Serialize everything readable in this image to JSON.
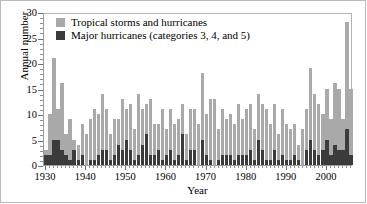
{
  "chart_data": {
    "type": "bar",
    "title": "",
    "xlabel": "Year",
    "ylabel": "Annual number",
    "xlim": [
      1929.5,
      2006.5
    ],
    "ylim": [
      0,
      30
    ],
    "yticks": [
      0,
      5,
      10,
      15,
      20,
      25,
      30
    ],
    "xticks": [
      1930,
      1940,
      1950,
      1960,
      1970,
      1980,
      1990,
      2000
    ],
    "grid": false,
    "stacked": true,
    "legend_position": "top-left",
    "colors": {
      "total": "#a9a9a9",
      "major": "#3b3b3b"
    },
    "series": [
      {
        "name": "Tropical storms and hurricanes",
        "color": "#a9a9a9",
        "values": [
          3,
          10,
          21,
          11,
          16,
          6,
          9,
          5,
          4,
          8,
          6,
          9,
          11,
          10,
          14,
          11,
          6,
          9,
          9,
          13,
          11,
          12,
          7,
          14,
          11,
          12,
          13,
          8,
          8,
          11,
          7,
          11,
          8,
          9,
          12,
          6,
          11,
          11,
          8,
          18,
          10,
          13,
          13,
          7,
          11,
          9,
          10,
          8,
          12,
          9,
          11,
          12,
          7,
          14,
          12,
          11,
          8,
          12,
          6,
          11,
          8,
          7,
          8,
          4,
          7,
          11,
          19,
          14,
          12,
          10,
          15,
          9,
          16,
          15,
          9,
          28,
          15
        ]
      },
      {
        "name": "Major hurricanes (categories 3, 4, and 5)",
        "color": "#3b3b3b",
        "values": [
          2,
          2,
          5,
          5,
          3,
          2,
          1,
          3,
          1,
          2,
          0,
          1,
          1,
          2,
          3,
          3,
          1,
          2,
          4,
          3,
          5,
          3,
          1,
          2,
          4,
          6,
          2,
          2,
          3,
          1,
          2,
          3,
          1,
          2,
          6,
          1,
          3,
          3,
          0,
          5,
          2,
          1,
          0,
          1,
          2,
          2,
          2,
          1,
          2,
          2,
          2,
          3,
          1,
          5,
          3,
          1,
          1,
          3,
          1,
          2,
          1,
          1,
          2,
          1,
          0,
          3,
          5,
          3,
          2,
          3,
          5,
          2,
          4,
          3,
          3,
          7,
          2
        ]
      }
    ],
    "years": [
      1930,
      1931,
      1932,
      1933,
      1934,
      1935,
      1936,
      1937,
      1938,
      1939,
      1940,
      1941,
      1942,
      1943,
      1944,
      1945,
      1946,
      1947,
      1948,
      1949,
      1950,
      1951,
      1952,
      1953,
      1954,
      1955,
      1956,
      1957,
      1958,
      1959,
      1960,
      1961,
      1962,
      1963,
      1964,
      1965,
      1966,
      1967,
      1968,
      1969,
      1970,
      1971,
      1972,
      1973,
      1974,
      1975,
      1976,
      1977,
      1978,
      1979,
      1980,
      1981,
      1982,
      1983,
      1984,
      1985,
      1986,
      1987,
      1988,
      1989,
      1990,
      1991,
      1992,
      1993,
      1994,
      1995,
      1996,
      1997,
      1998,
      1999,
      2000,
      2001,
      2002,
      2003,
      2004,
      2005,
      2006
    ]
  },
  "legend": {
    "items": [
      {
        "label": "Tropical storms and hurricanes",
        "swatch": "total"
      },
      {
        "label": "Major hurricanes (categories 3, 4, and 5)",
        "swatch": "major"
      }
    ]
  },
  "axes": {
    "y_title": "Annual number",
    "x_title": "Year",
    "y_tick_labels": [
      "0",
      "5",
      "10",
      "15",
      "20",
      "25",
      "30"
    ],
    "x_tick_labels": [
      "1930",
      "1940",
      "1950",
      "1960",
      "1970",
      "1980",
      "1990",
      "2000"
    ]
  }
}
